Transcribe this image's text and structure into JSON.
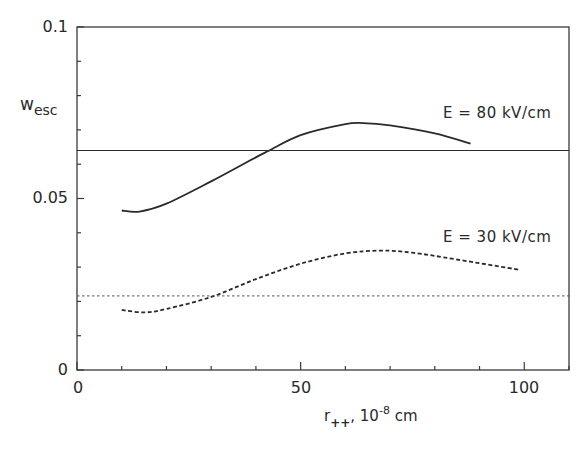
{
  "chart_data": {
    "type": "line",
    "title": "",
    "xlabel": "r++, 10^-8 cm",
    "xlabel_parts": {
      "main": "r",
      "sub": "++",
      "sep": ", 10",
      "sup": "-8",
      "unit": " cm"
    },
    "ylabel": "w_esc",
    "ylabel_parts": {
      "main": "w",
      "sub": "esc"
    },
    "xlim": [
      0,
      110
    ],
    "ylim": [
      0,
      0.1
    ],
    "x_ticks": [
      0,
      50,
      100
    ],
    "x_tick_labels": [
      "0",
      "50",
      "100"
    ],
    "x_minor_tick_step": 10,
    "y_ticks": [
      0,
      0.05,
      0.1
    ],
    "y_tick_labels": [
      "0",
      "0.05",
      "0.1"
    ],
    "y_minor_tick_step": 0.01,
    "grid": false,
    "legend": null,
    "series": [
      {
        "name": "E = 80 kV/cm",
        "style": "solid",
        "x": [
          10,
          14,
          20,
          30,
          40,
          43,
          50,
          60,
          64,
          70,
          80,
          88
        ],
        "y": [
          0.0465,
          0.0462,
          0.0485,
          0.055,
          0.062,
          0.064,
          0.0685,
          0.0717,
          0.072,
          0.0713,
          0.069,
          0.066
        ]
      },
      {
        "name": "E = 80 kV/cm reference level",
        "style": "solid-horizontal",
        "x": [
          0,
          110
        ],
        "y": [
          0.064,
          0.064
        ]
      },
      {
        "name": "E = 30 kV/cm",
        "style": "dashed",
        "x": [
          10,
          15,
          20,
          30,
          40,
          50,
          60,
          68,
          75,
          85,
          99
        ],
        "y": [
          0.0175,
          0.0168,
          0.0178,
          0.0213,
          0.0265,
          0.031,
          0.034,
          0.0348,
          0.0342,
          0.0322,
          0.0292
        ]
      },
      {
        "name": "E = 30 kV/cm reference level",
        "style": "dotted-horizontal",
        "x": [
          0,
          110
        ],
        "y": [
          0.0216,
          0.0216
        ]
      }
    ],
    "annotations": [
      {
        "text": "E = 80 kV/cm",
        "x": 82,
        "y": 0.076
      },
      {
        "text": "E = 30 kV/cm",
        "x": 82,
        "y": 0.039
      }
    ]
  },
  "labels": {
    "annot_80": "E = 80  kV/cm",
    "annot_30": "E = 30  kV/cm",
    "ytick_0": "0",
    "ytick_005": "0.05",
    "ytick_01": "0.1",
    "xtick_0": "0",
    "xtick_50": "50",
    "xtick_100": "100"
  },
  "colors": {
    "ink": "#2a2a2a",
    "frame": "#3a3a3a",
    "background": "#ffffff"
  }
}
